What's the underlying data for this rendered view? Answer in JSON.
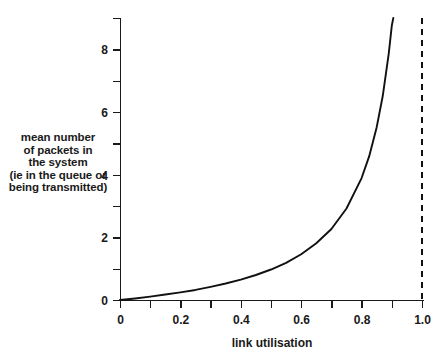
{
  "chart_data": {
    "type": "line",
    "title": "",
    "xlabel": "link utilisation",
    "ylabel_lines": [
      "mean number",
      "of packets in",
      "the system",
      "(ie in the queue or",
      "being transmitted)"
    ],
    "xlim": [
      0,
      1.04
    ],
    "ylim": [
      0,
      9.25
    ],
    "xticks_major": [
      0,
      0.2,
      0.4,
      0.6,
      0.8,
      1.0
    ],
    "xticks_major_labels": [
      "0",
      "0.2",
      "0.4",
      "0.6",
      "0.8",
      "1.0"
    ],
    "xticks_minor": [
      0.1,
      0.3,
      0.5,
      0.7,
      0.9
    ],
    "yticks_major": [
      0,
      2,
      4,
      6,
      8
    ],
    "yticks_major_labels": [
      "0",
      "2",
      "4",
      "6",
      "8"
    ],
    "yticks_minor": [
      1,
      3,
      5,
      7,
      9
    ],
    "grid": false,
    "legend": false,
    "series": [
      {
        "name": "mean number of packets in the system",
        "formula": "rho / (1 - rho)",
        "color": "#111111",
        "style": "solid",
        "x": [
          0,
          0.05,
          0.1,
          0.15,
          0.2,
          0.25,
          0.3,
          0.35,
          0.4,
          0.45,
          0.5,
          0.55,
          0.6,
          0.65,
          0.7,
          0.75,
          0.8,
          0.825,
          0.85,
          0.87,
          0.89,
          0.9,
          0.905,
          0.91
        ],
        "values": [
          0,
          0.05,
          0.11,
          0.18,
          0.25,
          0.33,
          0.43,
          0.54,
          0.67,
          0.82,
          1.0,
          1.22,
          1.5,
          1.86,
          2.33,
          3.0,
          4.0,
          4.71,
          5.67,
          6.69,
          8.09,
          9.0,
          9.53,
          10.1
        ]
      }
    ],
    "annotations": [
      {
        "name": "asymptote",
        "type": "vertical-dashed-line",
        "x": 1.0,
        "color": "#111111",
        "label": ""
      }
    ]
  },
  "plot_geometry": {
    "x0_px": 120,
    "x1_px": 422,
    "y0_px": 300,
    "ytop_px": 18
  }
}
